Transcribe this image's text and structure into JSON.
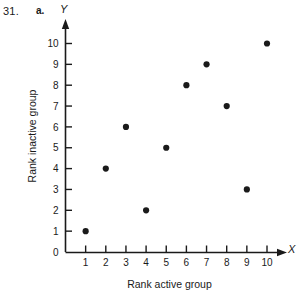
{
  "header": {
    "problem_number": "31.",
    "part_label": "a."
  },
  "chart_data": {
    "type": "scatter",
    "title": "",
    "xlabel": "Rank active group",
    "ylabel": "Rank inactive group",
    "x_axis_name": "X",
    "y_axis_name": "Y",
    "x": [
      1,
      2,
      3,
      4,
      5,
      6,
      7,
      8,
      9,
      10
    ],
    "y": [
      1,
      4,
      6,
      2,
      5,
      8,
      9,
      7,
      3,
      10
    ],
    "points": [
      {
        "x": 1,
        "y": 1
      },
      {
        "x": 2,
        "y": 4
      },
      {
        "x": 3,
        "y": 6
      },
      {
        "x": 4,
        "y": 2
      },
      {
        "x": 5,
        "y": 5
      },
      {
        "x": 6,
        "y": 8
      },
      {
        "x": 7,
        "y": 9
      },
      {
        "x": 8,
        "y": 7
      },
      {
        "x": 9,
        "y": 3
      },
      {
        "x": 10,
        "y": 10
      }
    ],
    "xlim": [
      0,
      10
    ],
    "ylim": [
      0,
      10
    ],
    "x_ticks": [
      "1",
      "2",
      "3",
      "4",
      "5",
      "6",
      "7",
      "8",
      "9",
      "10"
    ],
    "y_ticks": [
      "0",
      "1",
      "2",
      "3",
      "4",
      "5",
      "6",
      "7",
      "8",
      "9",
      "10"
    ],
    "grid": false,
    "legend": "none",
    "marker_color": "#1a1a1a",
    "axis_color": "#1a1a1a"
  }
}
